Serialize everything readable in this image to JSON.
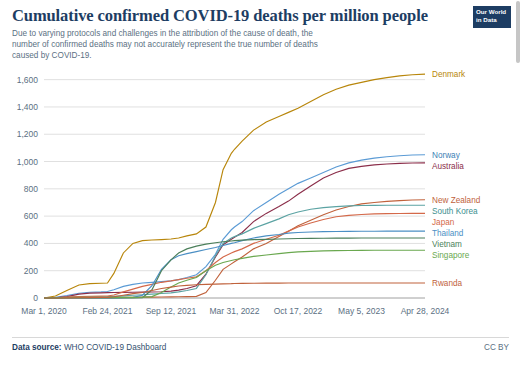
{
  "header": {
    "title": "Cumulative confirmed COVID-19 deaths per million people",
    "subtitle": "Due to varying protocols and challenges in the attribution of the cause of death, the number of confirmed deaths may not accurately represent the true number of deaths caused by COVID-19.",
    "logo_line1": "Our World",
    "logo_line2": "in Data"
  },
  "footer": {
    "source_label": "Data source:",
    "source_value": "WHO COVID-19 Dashboard",
    "license": "CC BY"
  },
  "chart_data": {
    "type": "line",
    "title": "Cumulative confirmed COVID-19 deaths per million people",
    "xlabel": "",
    "ylabel": "",
    "grid": true,
    "legend": "right-inline-labels",
    "ylim": [
      0,
      1700
    ],
    "yticks": [
      0,
      200,
      400,
      600,
      800,
      1000,
      1200,
      1400,
      1600
    ],
    "ytick_labels": [
      "0",
      "200",
      "400",
      "600",
      "800",
      "1,000",
      "1,200",
      "1,400",
      "1,600"
    ],
    "xticks": [
      0,
      1,
      2,
      3,
      4,
      5,
      6
    ],
    "xtick_labels": [
      "Mar 1, 2020",
      "Feb 24, 2021",
      "Sep 12, 2021",
      "Mar 31, 2022",
      "Oct 17, 2022",
      "May 5, 2023",
      "Apr 28, 2024"
    ],
    "x": [
      0,
      0.18,
      0.36,
      0.55,
      0.72,
      0.9,
      1.0,
      1.1,
      1.25,
      1.4,
      1.55,
      1.7,
      1.85,
      2.0,
      2.12,
      2.25,
      2.4,
      2.55,
      2.7,
      2.82,
      2.95,
      3.0,
      3.12,
      3.3,
      3.5,
      3.7,
      3.85,
      4.0,
      4.2,
      4.4,
      4.6,
      4.8,
      5.0,
      5.2,
      5.4,
      5.6,
      5.8,
      6.0
    ],
    "series": [
      {
        "name": "Denmark",
        "color": "#b8860b",
        "label_color": "#b8860b",
        "final_value": 1640,
        "values": [
          0,
          15,
          55,
          95,
          105,
          108,
          110,
          180,
          330,
          400,
          420,
          425,
          428,
          432,
          440,
          455,
          470,
          520,
          700,
          940,
          1060,
          1090,
          1150,
          1230,
          1290,
          1330,
          1360,
          1390,
          1440,
          1490,
          1530,
          1560,
          1580,
          1600,
          1615,
          1628,
          1636,
          1640
        ]
      },
      {
        "name": "Norway",
        "color": "#5b9bd5",
        "label_color": "#3d7fb5",
        "final_value": 1050,
        "values": [
          0,
          5,
          18,
          35,
          42,
          45,
          48,
          60,
          85,
          100,
          110,
          115,
          120,
          125,
          135,
          150,
          170,
          230,
          320,
          430,
          500,
          520,
          560,
          640,
          700,
          760,
          800,
          840,
          880,
          920,
          960,
          990,
          1010,
          1025,
          1035,
          1042,
          1048,
          1050
        ]
      },
      {
        "name": "Australia",
        "color": "#8b2e4a",
        "label_color": "#8b2e4a",
        "final_value": 990,
        "values": [
          0,
          2,
          10,
          28,
          36,
          38,
          39,
          40,
          41,
          42,
          43,
          44,
          46,
          50,
          58,
          70,
          90,
          175,
          300,
          390,
          430,
          445,
          480,
          560,
          620,
          670,
          710,
          760,
          820,
          880,
          920,
          950,
          965,
          975,
          982,
          986,
          989,
          990
        ]
      },
      {
        "name": "New Zealand",
        "color": "#c0623c",
        "label_color": "#c0623c",
        "final_value": 720,
        "values": [
          0,
          1,
          4,
          5,
          5,
          5,
          5,
          5,
          5,
          5,
          6,
          6,
          7,
          8,
          9,
          10,
          12,
          40,
          130,
          210,
          250,
          265,
          300,
          360,
          400,
          450,
          490,
          530,
          570,
          610,
          645,
          670,
          690,
          700,
          708,
          714,
          718,
          720
        ]
      },
      {
        "name": "South Korea",
        "color": "#5ba3a3",
        "label_color": "#3d8f8f",
        "final_value": 680,
        "values": [
          0,
          2,
          5,
          7,
          8,
          9,
          10,
          12,
          16,
          20,
          24,
          28,
          33,
          38,
          45,
          55,
          70,
          170,
          310,
          400,
          440,
          450,
          470,
          510,
          545,
          580,
          610,
          630,
          650,
          662,
          670,
          675,
          678,
          679,
          680,
          680,
          680,
          680
        ]
      },
      {
        "name": "Japan",
        "color": "#d4694a",
        "label_color": "#d4694a",
        "final_value": 620,
        "values": [
          0,
          2,
          6,
          10,
          13,
          14,
          15,
          22,
          45,
          65,
          85,
          100,
          115,
          125,
          135,
          145,
          155,
          200,
          260,
          300,
          330,
          340,
          360,
          400,
          430,
          460,
          490,
          520,
          550,
          575,
          595,
          605,
          612,
          616,
          618,
          619,
          620,
          620
        ]
      },
      {
        "name": "Thailand",
        "color": "#4b8fc4",
        "label_color": "#4b8fc4",
        "final_value": 490,
        "values": [
          0,
          0.5,
          1,
          1,
          1,
          1,
          1,
          1,
          2,
          5,
          20,
          90,
          210,
          280,
          310,
          325,
          340,
          355,
          370,
          385,
          400,
          405,
          420,
          440,
          455,
          465,
          475,
          480,
          484,
          486,
          487,
          488,
          489,
          489,
          490,
          490,
          490,
          490
        ]
      },
      {
        "name": "Vietnam",
        "color": "#4b7f5a",
        "label_color": "#4b7f5a",
        "final_value": 440,
        "values": [
          0,
          0,
          0,
          0,
          0,
          0,
          0,
          0,
          0,
          0.3,
          2,
          60,
          200,
          280,
          330,
          360,
          380,
          395,
          405,
          412,
          418,
          420,
          424,
          428,
          430,
          432,
          434,
          436,
          437,
          438,
          439,
          439,
          440,
          440,
          440,
          440,
          440,
          440
        ]
      },
      {
        "name": "Singapore",
        "color": "#6aa84f",
        "label_color": "#6aa84f",
        "final_value": 350,
        "values": [
          0,
          1,
          4,
          5,
          5,
          5,
          5,
          5,
          5,
          5,
          6,
          10,
          40,
          80,
          110,
          130,
          150,
          200,
          240,
          260,
          275,
          280,
          290,
          305,
          315,
          325,
          332,
          338,
          342,
          345,
          347,
          348,
          349,
          350,
          350,
          350,
          350,
          350
        ]
      },
      {
        "name": "Rwanda",
        "color": "#c0623c",
        "label_color": "#c0623c",
        "final_value": 110,
        "values": [
          0,
          0.2,
          1,
          2,
          3,
          4,
          5,
          9,
          20,
          32,
          40,
          55,
          70,
          80,
          88,
          93,
          97,
          100,
          102,
          104,
          105,
          106,
          107,
          108,
          109,
          109,
          110,
          110,
          110,
          110,
          110,
          110,
          110,
          110,
          110,
          110,
          110,
          110
        ]
      }
    ]
  }
}
